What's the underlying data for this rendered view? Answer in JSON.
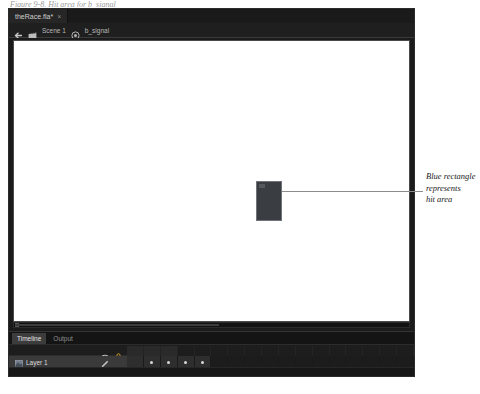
{
  "figure": {
    "caption_sliver": "Figure 9-8. Hit area for b_signal"
  },
  "app": {
    "document_tab": {
      "title": "theRace.fla*",
      "close_label": "×"
    },
    "breadcrumb": {
      "back_icon": "back-arrow-icon",
      "scene_icon": "scene-clapboard-icon",
      "scene_label": "Scene 1",
      "symbol_icon": "movie-clip-symbol-icon",
      "symbol_label": "b_signal"
    },
    "stage": {
      "background": "#ffffff",
      "selection": {
        "name": "hit-area-rectangle",
        "fill": "#3a3d41",
        "border": "#6f737a"
      },
      "scrollbar": {
        "orientation": "horizontal"
      }
    },
    "timeline": {
      "tabs": [
        {
          "label": "Timeline",
          "active": true
        },
        {
          "label": "Output",
          "active": false
        }
      ],
      "header_icons": [
        {
          "name": "eye-icon",
          "label": "Show/Hide"
        },
        {
          "name": "lock-icon",
          "label": "Lock/Unlock",
          "color": "#d8a325"
        }
      ],
      "layers": [
        {
          "icon": "layer-icon",
          "name": "Layer 1",
          "pencil_icon": "pencil-icon",
          "visible_dot": true,
          "lock_dot": true
        }
      ],
      "frames": [
        {
          "filled": true,
          "keyframe": false
        },
        {
          "filled": true,
          "keyframe": true
        },
        {
          "filled": true,
          "keyframe": true
        },
        {
          "filled": true,
          "keyframe": true
        },
        {
          "filled": true,
          "keyframe": true
        },
        {
          "filled": false,
          "keyframe": false
        },
        {
          "filled": false,
          "keyframe": false
        },
        {
          "filled": false,
          "keyframe": false
        },
        {
          "filled": false,
          "keyframe": false
        },
        {
          "filled": false,
          "keyframe": false
        },
        {
          "filled": false,
          "keyframe": false
        },
        {
          "filled": false,
          "keyframe": false
        },
        {
          "filled": false,
          "keyframe": false
        },
        {
          "filled": false,
          "keyframe": false
        },
        {
          "filled": false,
          "keyframe": false
        },
        {
          "filled": false,
          "keyframe": false
        },
        {
          "filled": false,
          "keyframe": false
        }
      ],
      "ruler_cells": [
        true,
        true,
        true,
        false,
        false,
        false,
        false,
        false,
        false,
        false,
        false,
        false,
        false,
        false,
        false,
        false,
        false
      ]
    }
  },
  "callout": {
    "line1": "Blue rectangle",
    "line2": "represents",
    "line3": "hit area"
  }
}
